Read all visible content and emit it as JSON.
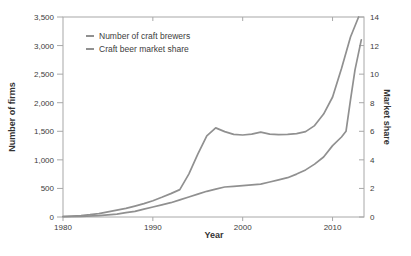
{
  "figure": {
    "background": "#ffffff",
    "line_color": "#909090",
    "spine_color": "#a8a8a8",
    "text_color": "#3c3c3c"
  },
  "chart_data": {
    "type": "line",
    "title": "",
    "xlabel": "Year",
    "ylabel_left": "Number of firms",
    "ylabel_right": "Market share",
    "grid": false,
    "legend_position": "upper-left",
    "x_range": [
      1980,
      2013.5
    ],
    "y_left_range": [
      0,
      3500
    ],
    "y_right_range": [
      0,
      14
    ],
    "x_ticks": [
      {
        "v": 1980,
        "label": "1980"
      },
      {
        "v": 1990,
        "label": "1990"
      },
      {
        "v": 2000,
        "label": "2000"
      },
      {
        "v": 2010,
        "label": "2010"
      }
    ],
    "y_left_ticks": [
      {
        "v": 0,
        "label": "0"
      },
      {
        "v": 500,
        "label": "500"
      },
      {
        "v": 1000,
        "label": "1,000"
      },
      {
        "v": 1500,
        "label": "1,500"
      },
      {
        "v": 2000,
        "label": "2,000"
      },
      {
        "v": 2500,
        "label": "2,500"
      },
      {
        "v": 3000,
        "label": "3,000"
      },
      {
        "v": 3500,
        "label": "3,500"
      }
    ],
    "y_right_ticks": [
      {
        "v": 0,
        "label": "0"
      },
      {
        "v": 2,
        "label": "2"
      },
      {
        "v": 4,
        "label": "4"
      },
      {
        "v": 6,
        "label": "6"
      },
      {
        "v": 8,
        "label": "8"
      },
      {
        "v": 10,
        "label": "10"
      },
      {
        "v": 12,
        "label": "12"
      },
      {
        "v": 14,
        "label": "14"
      }
    ],
    "series": [
      {
        "name": "Number of craft brewers",
        "axis": "left",
        "points": [
          [
            1980,
            8
          ],
          [
            1981,
            15
          ],
          [
            1982,
            25
          ],
          [
            1983,
            40
          ],
          [
            1984,
            60
          ],
          [
            1985,
            90
          ],
          [
            1986,
            120
          ],
          [
            1987,
            150
          ],
          [
            1988,
            190
          ],
          [
            1989,
            235
          ],
          [
            1990,
            285
          ],
          [
            1991,
            345
          ],
          [
            1992,
            410
          ],
          [
            1993,
            480
          ],
          [
            1994,
            750
          ],
          [
            1995,
            1100
          ],
          [
            1996,
            1420
          ],
          [
            1997,
            1560
          ],
          [
            1998,
            1495
          ],
          [
            1999,
            1445
          ],
          [
            2000,
            1435
          ],
          [
            2001,
            1450
          ],
          [
            2002,
            1485
          ],
          [
            2003,
            1450
          ],
          [
            2004,
            1440
          ],
          [
            2005,
            1445
          ],
          [
            2006,
            1460
          ],
          [
            2007,
            1495
          ],
          [
            2008,
            1600
          ],
          [
            2009,
            1800
          ],
          [
            2010,
            2100
          ],
          [
            2011,
            2600
          ],
          [
            2012,
            3150
          ],
          [
            2012.9,
            3500
          ]
        ]
      },
      {
        "name": "Craft beer market share",
        "axis": "right",
        "points": [
          [
            1980,
            0.02
          ],
          [
            1982,
            0.05
          ],
          [
            1984,
            0.1
          ],
          [
            1986,
            0.2
          ],
          [
            1987,
            0.3
          ],
          [
            1988,
            0.4
          ],
          [
            1989,
            0.55
          ],
          [
            1990,
            0.7
          ],
          [
            1991,
            0.85
          ],
          [
            1992,
            1.0
          ],
          [
            1993,
            1.2
          ],
          [
            1994,
            1.4
          ],
          [
            1995,
            1.6
          ],
          [
            1996,
            1.8
          ],
          [
            1997,
            1.95
          ],
          [
            1998,
            2.1
          ],
          [
            1999,
            2.15
          ],
          [
            2000,
            2.2
          ],
          [
            2001,
            2.25
          ],
          [
            2002,
            2.3
          ],
          [
            2003,
            2.45
          ],
          [
            2004,
            2.6
          ],
          [
            2005,
            2.75
          ],
          [
            2006,
            3.0
          ],
          [
            2007,
            3.3
          ],
          [
            2008,
            3.7
          ],
          [
            2009,
            4.2
          ],
          [
            2010,
            5.0
          ],
          [
            2011,
            5.6
          ],
          [
            2011.5,
            6.0
          ],
          [
            2012,
            8.2
          ],
          [
            2012.5,
            10.3
          ],
          [
            2013.2,
            12.4
          ]
        ]
      }
    ]
  },
  "legend": {
    "items": [
      {
        "label": "Number of craft brewers"
      },
      {
        "label": "Craft beer market share"
      }
    ]
  }
}
